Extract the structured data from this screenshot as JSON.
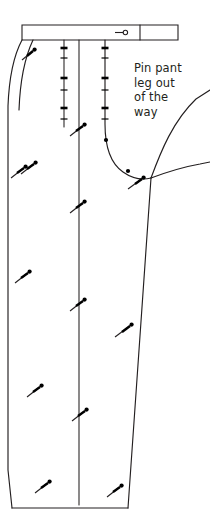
{
  "illustration": {
    "title": "Pin pant leg out of the way",
    "subject": "pants-front-pattern-piece",
    "background_color": "#ffffff",
    "line_color": "#231f20",
    "pin_color": "#000000",
    "annotation": {
      "lines": [
        "Pin pant",
        "leg out",
        "of the",
        "way"
      ],
      "x": 134,
      "y": 72,
      "line_height": 14.5,
      "font_size": 11.5,
      "color": "#231f20"
    },
    "waistband": {
      "label": "waistband",
      "top_left_x": 22,
      "top_y": 25,
      "bottom_y": 40,
      "right_x": 178,
      "divider_x": 140,
      "buttonhole": {
        "label": "buttonhole-marking",
        "x": 123,
        "y": 32,
        "stem_length": 8,
        "circle_radius": 2.1
      }
    },
    "outline_paths": {
      "side_seam_outer": "M 22,40 C 14,56 9,82 8,108 L 8,470 L 12,508",
      "side_seam_inner": "M 32,40 C 24,58 19,84 18,110",
      "hem_line": "M 12,508 L 128,508",
      "leg_right_edge": "M 151,178 L 128,508",
      "crotch_curve": "M 105,40 L 105,126 C 105,146 110,163 123,172 C 133,179 143,180 151,178",
      "pinned_leg_upper": "M 151,178 C 160,152 172,122 196,98 L 210,90",
      "pinned_leg_lower": "M 151,178 C 166,172 182,168 200,164 L 210,163"
    },
    "basting_lines": [
      {
        "label": "left-basting-line",
        "x": 64,
        "y_top": 40,
        "y_bottom": 126
      },
      {
        "label": "center-crease-line",
        "x": 79,
        "y_top": 40,
        "y_bottom": 505
      }
    ],
    "cross_pins": [
      {
        "line": "left-basting-line",
        "x": 64,
        "y": 48
      },
      {
        "line": "left-basting-line",
        "x": 64,
        "y": 58
      },
      {
        "line": "left-basting-line",
        "x": 64,
        "y": 78
      },
      {
        "line": "left-basting-line",
        "x": 64,
        "y": 90
      },
      {
        "line": "left-basting-line",
        "x": 64,
        "y": 108
      },
      {
        "line": "left-basting-line",
        "x": 64,
        "y": 118
      },
      {
        "line": "fly-line",
        "x": 105,
        "y": 48
      },
      {
        "line": "fly-line",
        "x": 105,
        "y": 58
      },
      {
        "line": "fly-line",
        "x": 105,
        "y": 78
      },
      {
        "line": "fly-line",
        "x": 105,
        "y": 90
      },
      {
        "line": "fly-line",
        "x": 105,
        "y": 108
      },
      {
        "line": "fly-line",
        "x": 105,
        "y": 118
      },
      {
        "line": "crotch-curve",
        "x": 108,
        "y": 140
      },
      {
        "line": "crotch-curve",
        "x": 128,
        "y": 170
      }
    ],
    "straight_pins": [
      {
        "label": "pin-side-upper",
        "tail_x": 22,
        "tail_y": 59,
        "head_x": 34,
        "head_y": 50
      },
      {
        "label": "pin-side-mid",
        "tail_x": 20,
        "tail_y": 172,
        "head_x": 34,
        "head_y": 162
      },
      {
        "label": "pin-side-low",
        "tail_x": 10,
        "tail_y": 176,
        "head_x": 24,
        "head_y": 166
      },
      {
        "label": "pin-seam-a",
        "tail_x": 14,
        "tail_y": 282,
        "head_x": 28,
        "head_y": 272
      },
      {
        "label": "pin-seam-b",
        "tail_x": 26,
        "tail_y": 396,
        "head_x": 40,
        "head_y": 386
      },
      {
        "label": "pin-seam-c",
        "tail_x": 34,
        "tail_y": 492,
        "head_x": 48,
        "head_y": 482
      },
      {
        "label": "pin-crease-a",
        "tail_x": 70,
        "tail_y": 135,
        "head_x": 84,
        "head_y": 124
      },
      {
        "label": "pin-crease-b",
        "tail_x": 70,
        "tail_y": 212,
        "head_x": 84,
        "head_y": 202
      },
      {
        "label": "pin-crease-c",
        "tail_x": 70,
        "tail_y": 310,
        "head_x": 84,
        "head_y": 300
      },
      {
        "label": "pin-crease-d",
        "tail_x": 72,
        "tail_y": 420,
        "head_x": 86,
        "head_y": 410
      },
      {
        "label": "pin-right-a",
        "tail_x": 128,
        "tail_y": 188,
        "head_x": 142,
        "head_y": 178
      },
      {
        "label": "pin-right-b",
        "tail_x": 114,
        "tail_y": 336,
        "head_x": 130,
        "head_y": 324
      },
      {
        "label": "pin-right-c",
        "tail_x": 106,
        "tail_y": 496,
        "head_x": 120,
        "head_y": 486
      }
    ]
  }
}
